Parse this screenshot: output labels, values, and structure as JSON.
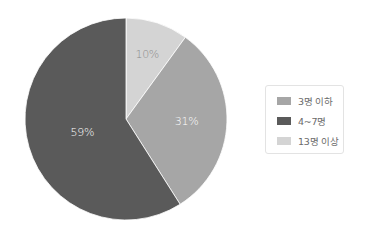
{
  "chart_data": {
    "type": "pie",
    "title": "",
    "start_angle_deg": 0,
    "direction": "clockwise",
    "categories": [
      "13명 이상",
      "3명 이하",
      "4~7명"
    ],
    "values": [
      10,
      31,
      59
    ],
    "unit": "%",
    "colors": [
      "#d4d4d4",
      "#a6a6a6",
      "#5a5a5a"
    ],
    "data_labels": [
      "10%",
      "31%",
      "59%"
    ],
    "label_colors": [
      "#8a8a8a",
      "#ffffff",
      "#ffffff"
    ],
    "legend_position": "right"
  },
  "legend": {
    "items": [
      {
        "label": "3명 이하",
        "color": "#a6a6a6"
      },
      {
        "label": "4~7명",
        "color": "#5a5a5a"
      },
      {
        "label": "13명 이상",
        "color": "#d4d4d4"
      }
    ]
  },
  "style": {
    "background": "#ffffff",
    "legend_border": "#e3e3e3"
  }
}
